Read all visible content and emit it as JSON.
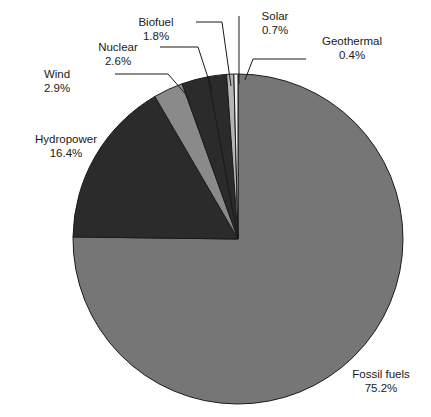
{
  "chart": {
    "type": "pie",
    "title": "",
    "background_color": "#ffffff",
    "text_color": "#1a1a1a",
    "outline_color": "#1a1a1a"
  },
  "chart_data": {
    "type": "pie",
    "title": "",
    "subtitle": "",
    "xlabel": "",
    "ylabel": "",
    "legend_position": "none",
    "labels_position": "outside-with-leader-lines",
    "units": "percent",
    "total": 100.0,
    "categories": [
      "Fossil fuels",
      "Hydropower",
      "Wind",
      "Nuclear",
      "Biofuel",
      "Solar",
      "Geothermal"
    ],
    "values": [
      75.2,
      16.4,
      2.9,
      2.6,
      1.8,
      0.7,
      0.4
    ],
    "slices": [
      {
        "name": "Fossil fuels",
        "value": 75.2,
        "value_label": "75.2%",
        "color": "#767676"
      },
      {
        "name": "Hydropower",
        "value": 16.4,
        "value_label": "16.4%",
        "color": "#2b2b2b"
      },
      {
        "name": "Wind",
        "value": 2.9,
        "value_label": "2.9%",
        "color": "#8a8a8a"
      },
      {
        "name": "Nuclear",
        "value": 2.6,
        "value_label": "2.6%",
        "color": "#2b2b2b"
      },
      {
        "name": "Biofuel",
        "value": 1.8,
        "value_label": "1.8%",
        "color": "#2b2b2b"
      },
      {
        "name": "Solar",
        "value": 0.7,
        "value_label": "0.7%",
        "color": "#b5b5b5"
      },
      {
        "name": "Geothermal",
        "value": 0.4,
        "value_label": "0.4%",
        "color": "#efefef"
      }
    ],
    "geometry": {
      "center_x": 238,
      "center_y": 239,
      "radius": 165,
      "start_angle_deg": -90,
      "direction": "clockwise"
    }
  },
  "labels": {
    "fossil_fuels": {
      "name": "Fossil fuels",
      "value": "75.2%"
    },
    "hydropower": {
      "name": "Hydropower",
      "value": "16.4%"
    },
    "wind": {
      "name": "Wind",
      "value": "2.9%"
    },
    "nuclear": {
      "name": "Nuclear",
      "value": "2.6%"
    },
    "biofuel": {
      "name": "Biofuel",
      "value": "1.8%"
    },
    "solar": {
      "name": "Solar",
      "value": "0.7%"
    },
    "geothermal": {
      "name": "Geothermal",
      "value": "0.4%"
    }
  }
}
